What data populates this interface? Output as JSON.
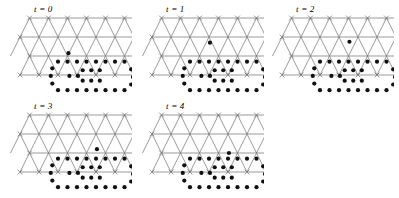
{
  "figure": {
    "type": "lattice-time-series",
    "panel_count": 5,
    "background_color": "#ffffff",
    "lattice_line_color": "#6e6e6e",
    "dot_color": "#111111"
  },
  "lattice": {
    "columns": 8,
    "rows": 4,
    "spacing_x": 19,
    "spacing_y": 19,
    "origin_x": 14,
    "origin_y": 6,
    "row_offsets": [
      9.5,
      0,
      9.5,
      0
    ],
    "vertex_marker": "x-cross"
  },
  "panels": [
    {
      "id": "panel-t0",
      "label": "t = 0",
      "time": 0,
      "x": 6,
      "y": 4,
      "ring_dots": [
        [
          2.0,
          2.3
        ],
        [
          2.5,
          2.3
        ],
        [
          3.0,
          2.3
        ],
        [
          3.5,
          2.3
        ],
        [
          4.0,
          2.3
        ],
        [
          4.5,
          2.3
        ],
        [
          5.0,
          2.3
        ],
        [
          5.5,
          2.3
        ],
        [
          5.85,
          2.7
        ],
        [
          5.95,
          3.1
        ],
        [
          5.85,
          3.5
        ],
        [
          5.5,
          3.8
        ],
        [
          5.0,
          3.8
        ],
        [
          4.5,
          3.8
        ],
        [
          4.0,
          3.8
        ],
        [
          3.5,
          3.8
        ],
        [
          3.0,
          3.8
        ],
        [
          2.5,
          3.8
        ],
        [
          2.0,
          3.8
        ],
        [
          1.7,
          3.45
        ],
        [
          1.62,
          3.05
        ],
        [
          1.7,
          2.65
        ],
        [
          3.3,
          2.75
        ],
        [
          3.75,
          2.75
        ],
        [
          4.2,
          2.75
        ],
        [
          3.3,
          3.3
        ],
        [
          3.75,
          3.3
        ],
        [
          4.2,
          3.3
        ],
        [
          2.6,
          3.05
        ],
        [
          3.05,
          3.05
        ]
      ],
      "free_dot": [
        2.55,
        1.85
      ],
      "free_dot_present": true
    },
    {
      "id": "panel-t1",
      "label": "t = 1",
      "time": 1,
      "x": 138,
      "y": 4,
      "ring_dots": [
        [
          2.0,
          2.3
        ],
        [
          2.5,
          2.3
        ],
        [
          3.0,
          2.3
        ],
        [
          3.5,
          2.3
        ],
        [
          4.0,
          2.3
        ],
        [
          4.5,
          2.3
        ],
        [
          5.0,
          2.3
        ],
        [
          5.5,
          2.3
        ],
        [
          5.85,
          2.7
        ],
        [
          5.95,
          3.1
        ],
        [
          5.85,
          3.5
        ],
        [
          5.5,
          3.8
        ],
        [
          5.0,
          3.8
        ],
        [
          4.5,
          3.8
        ],
        [
          4.0,
          3.8
        ],
        [
          3.5,
          3.8
        ],
        [
          3.0,
          3.8
        ],
        [
          2.5,
          3.8
        ],
        [
          2.0,
          3.8
        ],
        [
          1.7,
          3.45
        ],
        [
          1.62,
          3.05
        ],
        [
          1.7,
          2.65
        ],
        [
          3.3,
          2.75
        ],
        [
          3.75,
          2.75
        ],
        [
          4.2,
          2.75
        ],
        [
          3.3,
          3.3
        ],
        [
          3.75,
          3.3
        ],
        [
          4.2,
          3.3
        ],
        [
          2.6,
          3.05
        ],
        [
          3.05,
          3.05
        ]
      ],
      "free_dot": [
        3.05,
        1.3
      ],
      "free_dot_present": true
    },
    {
      "id": "panel-t2",
      "label": "t = 2",
      "time": 2,
      "x": 268,
      "y": 4,
      "ring_dots": [
        [
          2.0,
          2.3
        ],
        [
          2.5,
          2.3
        ],
        [
          3.0,
          2.3
        ],
        [
          3.5,
          2.3
        ],
        [
          4.0,
          2.3
        ],
        [
          4.5,
          2.3
        ],
        [
          5.0,
          2.3
        ],
        [
          5.5,
          2.3
        ],
        [
          5.85,
          2.7
        ],
        [
          5.95,
          3.1
        ],
        [
          5.85,
          3.5
        ],
        [
          5.5,
          3.8
        ],
        [
          5.0,
          3.8
        ],
        [
          4.5,
          3.8
        ],
        [
          4.0,
          3.8
        ],
        [
          3.5,
          3.8
        ],
        [
          3.0,
          3.8
        ],
        [
          2.5,
          3.8
        ],
        [
          2.0,
          3.8
        ],
        [
          1.7,
          3.45
        ],
        [
          1.62,
          3.05
        ],
        [
          1.7,
          2.65
        ],
        [
          3.3,
          2.75
        ],
        [
          3.75,
          2.75
        ],
        [
          4.2,
          2.75
        ],
        [
          3.3,
          3.3
        ],
        [
          3.75,
          3.3
        ],
        [
          4.2,
          3.3
        ],
        [
          2.6,
          3.05
        ],
        [
          3.05,
          3.05
        ]
      ],
      "free_dot": [
        3.55,
        1.25
      ],
      "free_dot_present": true
    },
    {
      "id": "panel-t3",
      "label": "t = 3",
      "time": 3,
      "x": 6,
      "y": 101,
      "ring_dots": [
        [
          2.0,
          2.3
        ],
        [
          2.5,
          2.3
        ],
        [
          3.0,
          2.3
        ],
        [
          3.5,
          2.3
        ],
        [
          4.0,
          2.3
        ],
        [
          4.5,
          2.3
        ],
        [
          5.0,
          2.3
        ],
        [
          5.5,
          2.3
        ],
        [
          5.85,
          2.7
        ],
        [
          5.95,
          3.1
        ],
        [
          5.85,
          3.5
        ],
        [
          5.5,
          3.8
        ],
        [
          5.0,
          3.8
        ],
        [
          4.5,
          3.8
        ],
        [
          4.0,
          3.8
        ],
        [
          3.5,
          3.8
        ],
        [
          3.0,
          3.8
        ],
        [
          2.5,
          3.8
        ],
        [
          2.0,
          3.8
        ],
        [
          1.7,
          3.45
        ],
        [
          1.62,
          3.05
        ],
        [
          1.7,
          2.65
        ],
        [
          3.3,
          2.75
        ],
        [
          3.75,
          2.75
        ],
        [
          4.2,
          2.75
        ],
        [
          3.3,
          3.3
        ],
        [
          3.75,
          3.3
        ],
        [
          4.2,
          3.3
        ],
        [
          2.6,
          3.05
        ],
        [
          3.05,
          3.05
        ]
      ],
      "free_dot": [
        4.05,
        1.8
      ],
      "free_dot_present": true
    },
    {
      "id": "panel-t4",
      "label": "t = 4",
      "time": 4,
      "x": 138,
      "y": 101,
      "ring_dots": [
        [
          2.0,
          2.3
        ],
        [
          2.5,
          2.3
        ],
        [
          3.0,
          2.3
        ],
        [
          3.5,
          2.3
        ],
        [
          4.0,
          2.3
        ],
        [
          4.5,
          2.3
        ],
        [
          5.0,
          2.3
        ],
        [
          5.5,
          2.3
        ],
        [
          5.85,
          2.7
        ],
        [
          5.95,
          3.1
        ],
        [
          5.85,
          3.5
        ],
        [
          5.5,
          3.8
        ],
        [
          5.0,
          3.8
        ],
        [
          4.5,
          3.8
        ],
        [
          4.0,
          3.8
        ],
        [
          3.5,
          3.8
        ],
        [
          3.0,
          3.8
        ],
        [
          2.5,
          3.8
        ],
        [
          2.0,
          3.8
        ],
        [
          1.7,
          3.45
        ],
        [
          1.62,
          3.05
        ],
        [
          1.7,
          2.65
        ],
        [
          3.3,
          2.75
        ],
        [
          3.75,
          2.75
        ],
        [
          4.2,
          2.75
        ],
        [
          3.3,
          3.3
        ],
        [
          3.75,
          3.3
        ],
        [
          4.2,
          3.3
        ],
        [
          2.6,
          3.05
        ],
        [
          3.05,
          3.05
        ]
      ],
      "free_dot": [
        4.05,
        2.0
      ],
      "free_dot_present": true
    }
  ]
}
